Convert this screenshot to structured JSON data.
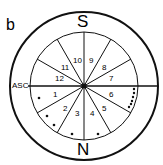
{
  "panel_label": "b",
  "cardinal": {
    "top": "S",
    "bottom": "N"
  },
  "ascendant_label": "ASC",
  "houses": [
    "1",
    "2",
    "3",
    "4",
    "5",
    "6",
    "7",
    "8",
    "9",
    "10",
    "11",
    "12"
  ],
  "colors": {
    "ink": "#111111",
    "background": "#ffffff"
  }
}
